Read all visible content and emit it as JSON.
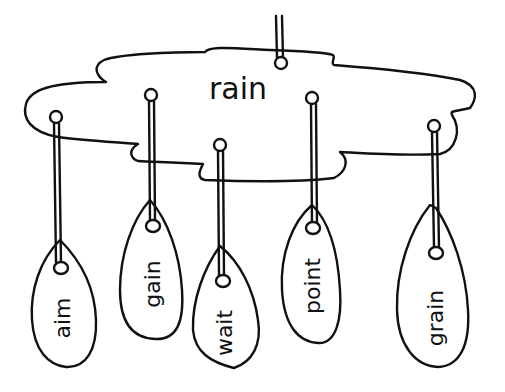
{
  "diagram": {
    "type": "word-family-mobile",
    "ink_color": "#111111",
    "background_color": "#ffffff",
    "cloud": {
      "label": "rain"
    },
    "tags": [
      {
        "label": "aim"
      },
      {
        "label": "gain"
      },
      {
        "label": "wait"
      },
      {
        "label": "point"
      },
      {
        "label": "grain"
      }
    ]
  }
}
